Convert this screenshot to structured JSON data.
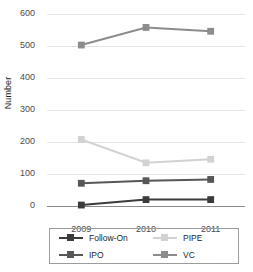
{
  "chart_data": {
    "type": "line",
    "title": "",
    "xlabel": "",
    "ylabel": "Number",
    "categories": [
      "2009",
      "2010",
      "2011"
    ],
    "ylim": [
      0,
      600
    ],
    "yticks": [
      0,
      100,
      200,
      300,
      400,
      500,
      600
    ],
    "grid": true,
    "legend_position": "bottom",
    "series": [
      {
        "name": "Follow-On",
        "values": [
          3,
          20,
          20
        ],
        "color": "#3b3b3b"
      },
      {
        "name": "IPO",
        "values": [
          71,
          79,
          83
        ],
        "color": "#575757"
      },
      {
        "name": "PIPE",
        "values": [
          208,
          135,
          146
        ],
        "color": "#d2d2d2"
      },
      {
        "name": "VC",
        "values": [
          503,
          558,
          546
        ],
        "color": "#8c8c8c"
      }
    ]
  },
  "axis": {
    "ylabel": "Number",
    "ytick_labels": [
      "600",
      "500",
      "400",
      "300",
      "200",
      "100",
      "0"
    ],
    "xtick_labels": [
      "2009",
      "2010",
      "2011"
    ]
  },
  "legend": {
    "items": [
      {
        "label": "Follow-On",
        "color": "#3b3b3b"
      },
      {
        "label": "PIPE",
        "color": "#d2d2d2"
      },
      {
        "label": "IPO",
        "color": "#575757"
      },
      {
        "label": "VC",
        "color": "#8c8c8c"
      }
    ]
  },
  "colors": {
    "gridline": "#e3e3e3",
    "axis": "#8a8a8a",
    "text": "#231f20",
    "tick_text": "#4a4a4a",
    "legend_border": "#9c9c9c",
    "background": "#ffffff"
  }
}
